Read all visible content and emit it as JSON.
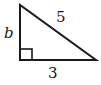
{
  "diagram": {
    "type": "right-triangle",
    "labels": {
      "hypotenuse": "5",
      "vertical_leg": "b",
      "horizontal_leg": "3"
    },
    "right_angle_marker": true,
    "stroke_color": "#1a1a1a",
    "background": "#ffffff"
  }
}
